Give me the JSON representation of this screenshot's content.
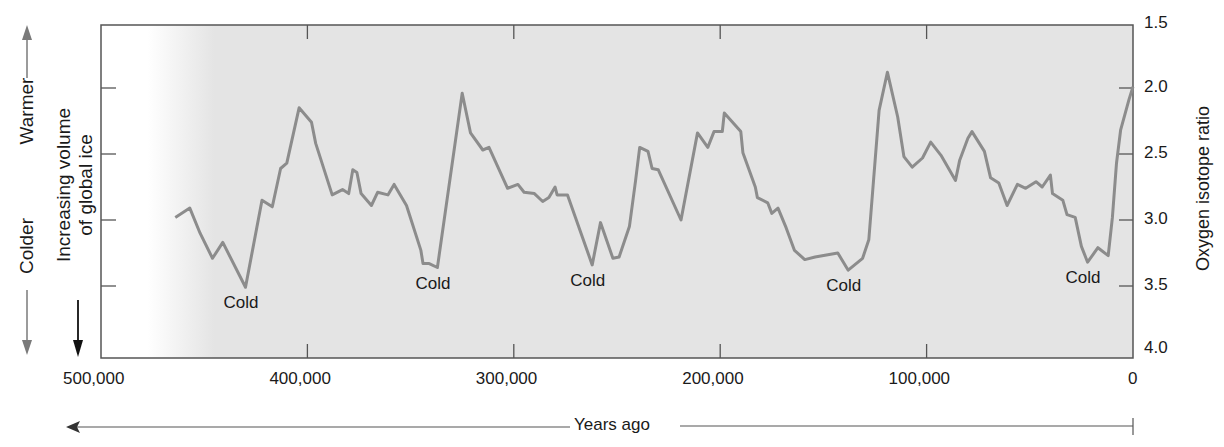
{
  "chart_data": {
    "type": "line",
    "title": "",
    "xlabel": "Years ago",
    "ylabel": "Oxygen isotope ratio",
    "xlim": [
      500000,
      0
    ],
    "ylim": [
      4.0,
      1.5
    ],
    "y_inverted": true,
    "x_ticks": [
      500000,
      400000,
      300000,
      200000,
      100000,
      0
    ],
    "x_tick_labels": [
      "500,000",
      "400,000",
      "300,000",
      "200,000",
      "100,000",
      "0"
    ],
    "y_ticks": [
      1.5,
      2.0,
      2.5,
      3.0,
      3.5,
      4.0
    ],
    "y_tick_labels": [
      "1.5",
      "2.0",
      "2.5",
      "3.0",
      "3.5",
      "4.0"
    ],
    "grid": false,
    "annotations": [
      {
        "text": "Cold",
        "x": 430000,
        "y": 3.51
      },
      {
        "text": "Cold",
        "x": 337000,
        "y": 3.36
      },
      {
        "text": "Cold",
        "x": 262000,
        "y": 3.34
      },
      {
        "text": "Cold",
        "x": 138000,
        "y": 3.38
      },
      {
        "text": "Cold",
        "x": 22000,
        "y": 3.32
      }
    ],
    "left_annotations": {
      "warmer": "Warmer",
      "colder": "Colder",
      "ice_line1": "Increasing volume",
      "ice_line2": "of global ice"
    },
    "series": [
      {
        "name": "Oxygen isotope ratio",
        "color": "#8c8c8c",
        "x": [
          464000,
          457000,
          452000,
          446000,
          441000,
          430000,
          422000,
          417000,
          413000,
          410000,
          404000,
          398000,
          396000,
          388000,
          383000,
          380000,
          378000,
          376000,
          374000,
          369000,
          366000,
          361000,
          358000,
          352000,
          345000,
          344000,
          341000,
          337000,
          325000,
          321000,
          315000,
          312000,
          303000,
          298000,
          295000,
          290000,
          286000,
          283000,
          280000,
          279000,
          274000,
          262000,
          258000,
          252000,
          249000,
          244000,
          241000,
          239000,
          235000,
          233000,
          230000,
          219000,
          211000,
          206000,
          203000,
          199000,
          198000,
          190000,
          189000,
          183000,
          182000,
          177000,
          175000,
          172000,
          168000,
          164000,
          159000,
          154000,
          143000,
          138000,
          131000,
          128000,
          123000,
          119000,
          114000,
          111000,
          107000,
          102000,
          98000,
          93000,
          86000,
          84000,
          80000,
          78000,
          72000,
          69000,
          65000,
          61000,
          56000,
          52000,
          47000,
          44000,
          40000,
          39000,
          34000,
          32000,
          28000,
          25000,
          22000,
          17000,
          12000,
          10000,
          8000,
          6000,
          2000,
          0
        ],
        "values": [
          2.98,
          2.91,
          3.1,
          3.29,
          3.17,
          3.51,
          2.85,
          2.9,
          2.61,
          2.57,
          2.15,
          2.26,
          2.42,
          2.81,
          2.77,
          2.8,
          2.62,
          2.64,
          2.8,
          2.89,
          2.79,
          2.81,
          2.73,
          2.89,
          3.23,
          3.33,
          3.33,
          3.36,
          2.04,
          2.34,
          2.47,
          2.45,
          2.76,
          2.73,
          2.79,
          2.8,
          2.86,
          2.83,
          2.75,
          2.81,
          2.81,
          3.34,
          3.02,
          3.29,
          3.28,
          3.05,
          2.7,
          2.45,
          2.48,
          2.61,
          2.62,
          3.0,
          2.34,
          2.45,
          2.33,
          2.33,
          2.19,
          2.33,
          2.49,
          2.75,
          2.83,
          2.87,
          2.95,
          2.91,
          3.06,
          3.23,
          3.3,
          3.28,
          3.25,
          3.38,
          3.29,
          3.15,
          2.17,
          1.88,
          2.22,
          2.52,
          2.6,
          2.53,
          2.41,
          2.51,
          2.7,
          2.55,
          2.38,
          2.33,
          2.48,
          2.68,
          2.72,
          2.89,
          2.73,
          2.76,
          2.71,
          2.75,
          2.66,
          2.8,
          2.85,
          2.96,
          2.98,
          3.2,
          3.32,
          3.21,
          3.27,
          2.98,
          2.57,
          2.32,
          2.09,
          1.99
        ]
      }
    ]
  },
  "colors": {
    "plot_background": "#e4e4e4",
    "line": "#8c8c8c",
    "axis": "#555555",
    "side_arrows": "#7a7a7a"
  }
}
